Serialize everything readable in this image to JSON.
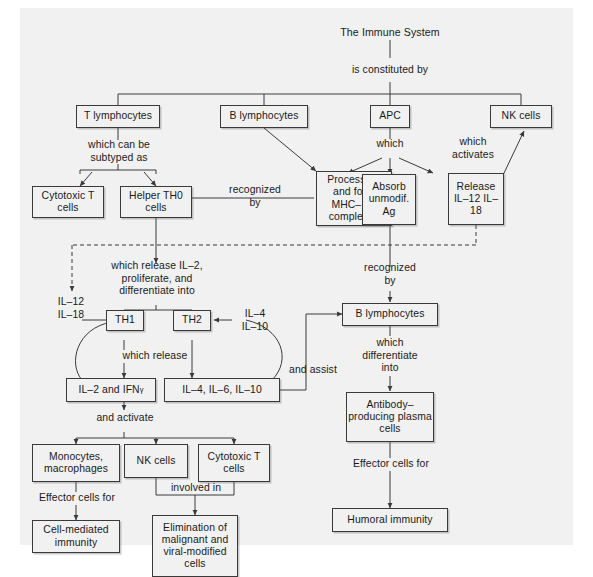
{
  "diagram": {
    "title": "The Immune System",
    "root_connector": "is constituted by",
    "level1": {
      "t_lymphocytes": "T lymphocytes",
      "b_lymphocytes": "B lymphocytes",
      "apc": "APC",
      "nk_cells": "NK cells"
    },
    "connectors": {
      "which_can_be_subtyped_as": "which can be\nsubtyped as",
      "which": "which",
      "which_activates": "which\nactivates",
      "recognized_by_left": "recognized\nby",
      "which_release_proliferate": "which release IL–2,\nproliferate, and\ndifferentiate into",
      "recognized_by_right": "recognized\nby",
      "which_release": "which release",
      "and_activate": "and activate",
      "and_assist": "and assist",
      "which_differentiate_into": "which\ndifferentiate\ninto",
      "effector_cells_for_left": "Effector cells for",
      "effector_cells_for_right": "Effector cells for",
      "involved_in": "involved in"
    },
    "boxes": {
      "cytotoxic_t_cells": "Cytotoxic\nT cells",
      "helper_th0_cells": "Helper\nTH0 cells",
      "process_ag": "Process Ag\nand form\nMHC–\nAg complexes",
      "absorb_unmodif_ag": "Absorb\nunmodif.\nAg",
      "release_il12_il18": "Release\nIL–12\nIL–18",
      "th1": "TH1",
      "th2": "TH2",
      "b_lymphocytes_2": "B lymphocytes",
      "il2_ifn_prefix": "IL–2 and IFN",
      "il2_ifn_sub": "γ",
      "il4_il6_il10": "IL–4, IL–6, IL–10",
      "antibody_plasma_cells": "Antibody–\nproducing\nplasma cells",
      "monocytes_macrophages": "Monocytes,\nmacrophages",
      "nk_cells_2": "NK cells",
      "cytotoxic_t_cells_2": "Cytotoxic\nT cells",
      "cell_mediated_immunity": "Cell-mediated\nimmunity",
      "elimination": "Elimination of\nmalignant and\nviral-modified\ncells",
      "humoral_immunity": "Humoral immunity"
    },
    "side_labels": {
      "il12_il18_left": "IL–12\nIL–18",
      "il4_il10_right": "IL–4\nIL–10"
    },
    "colors": {
      "page_background": "#f1f1f1",
      "outer_background": "#ffffff",
      "line": "#3a3a3a",
      "text": "#1a1a1a"
    }
  }
}
